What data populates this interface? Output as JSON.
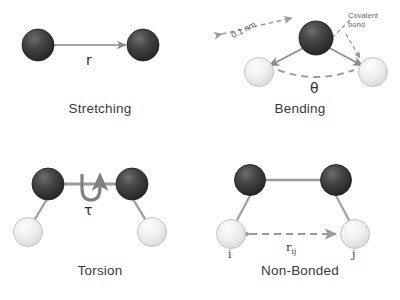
{
  "figure": {
    "background_color": "#ffffff",
    "colors": {
      "dark_atom": "#3a3a3a",
      "dark_atom_highlight": "#6e6e6e",
      "dark_atom_edge": "#1c1c1c",
      "light_atom": "#ececec",
      "light_atom_highlight": "#fdfdfd",
      "light_atom_edge": "#c4c4c4",
      "bond": "#8c8c8c",
      "arrow": "#8a8a8a",
      "dashed_arrow": "#9a9a9a",
      "caption_text": "#3a3a3a",
      "annotation_text": "#6a6a6a"
    }
  },
  "panels": {
    "stretching": {
      "caption": "Stretching",
      "distance_symbol": "r",
      "atoms": [
        {
          "name": "atom-left",
          "type": "dark"
        },
        {
          "name": "atom-right",
          "type": "dark"
        }
      ],
      "arrow": {
        "name": "stretch-arrow",
        "style": "solid",
        "heads": "double"
      }
    },
    "bending": {
      "caption": "Bending",
      "angle_symbol": "θ",
      "bond_length_label": "0.1 nm",
      "covalent_bond_label_line1": "Covalent",
      "covalent_bond_label_line2": "bond",
      "atoms": [
        {
          "name": "atom-center",
          "type": "dark"
        },
        {
          "name": "atom-left",
          "type": "light"
        },
        {
          "name": "atom-right",
          "type": "light"
        }
      ]
    },
    "torsion": {
      "caption": "Torsion",
      "torsion_symbol": "τ",
      "atoms": [
        {
          "name": "atom-dark-left",
          "type": "dark"
        },
        {
          "name": "atom-dark-right",
          "type": "dark"
        },
        {
          "name": "atom-light-left",
          "type": "light"
        },
        {
          "name": "atom-light-right",
          "type": "light"
        }
      ]
    },
    "nonbonded": {
      "caption": "Non-Bonded",
      "distance_symbol_base": "r",
      "distance_symbol_sub": "ij",
      "index_i": "i",
      "index_j": "j",
      "atoms": [
        {
          "name": "atom-dark-left",
          "type": "dark"
        },
        {
          "name": "atom-dark-right",
          "type": "dark"
        },
        {
          "name": "atom-light-left",
          "type": "light"
        },
        {
          "name": "atom-light-right",
          "type": "light"
        }
      ]
    }
  }
}
